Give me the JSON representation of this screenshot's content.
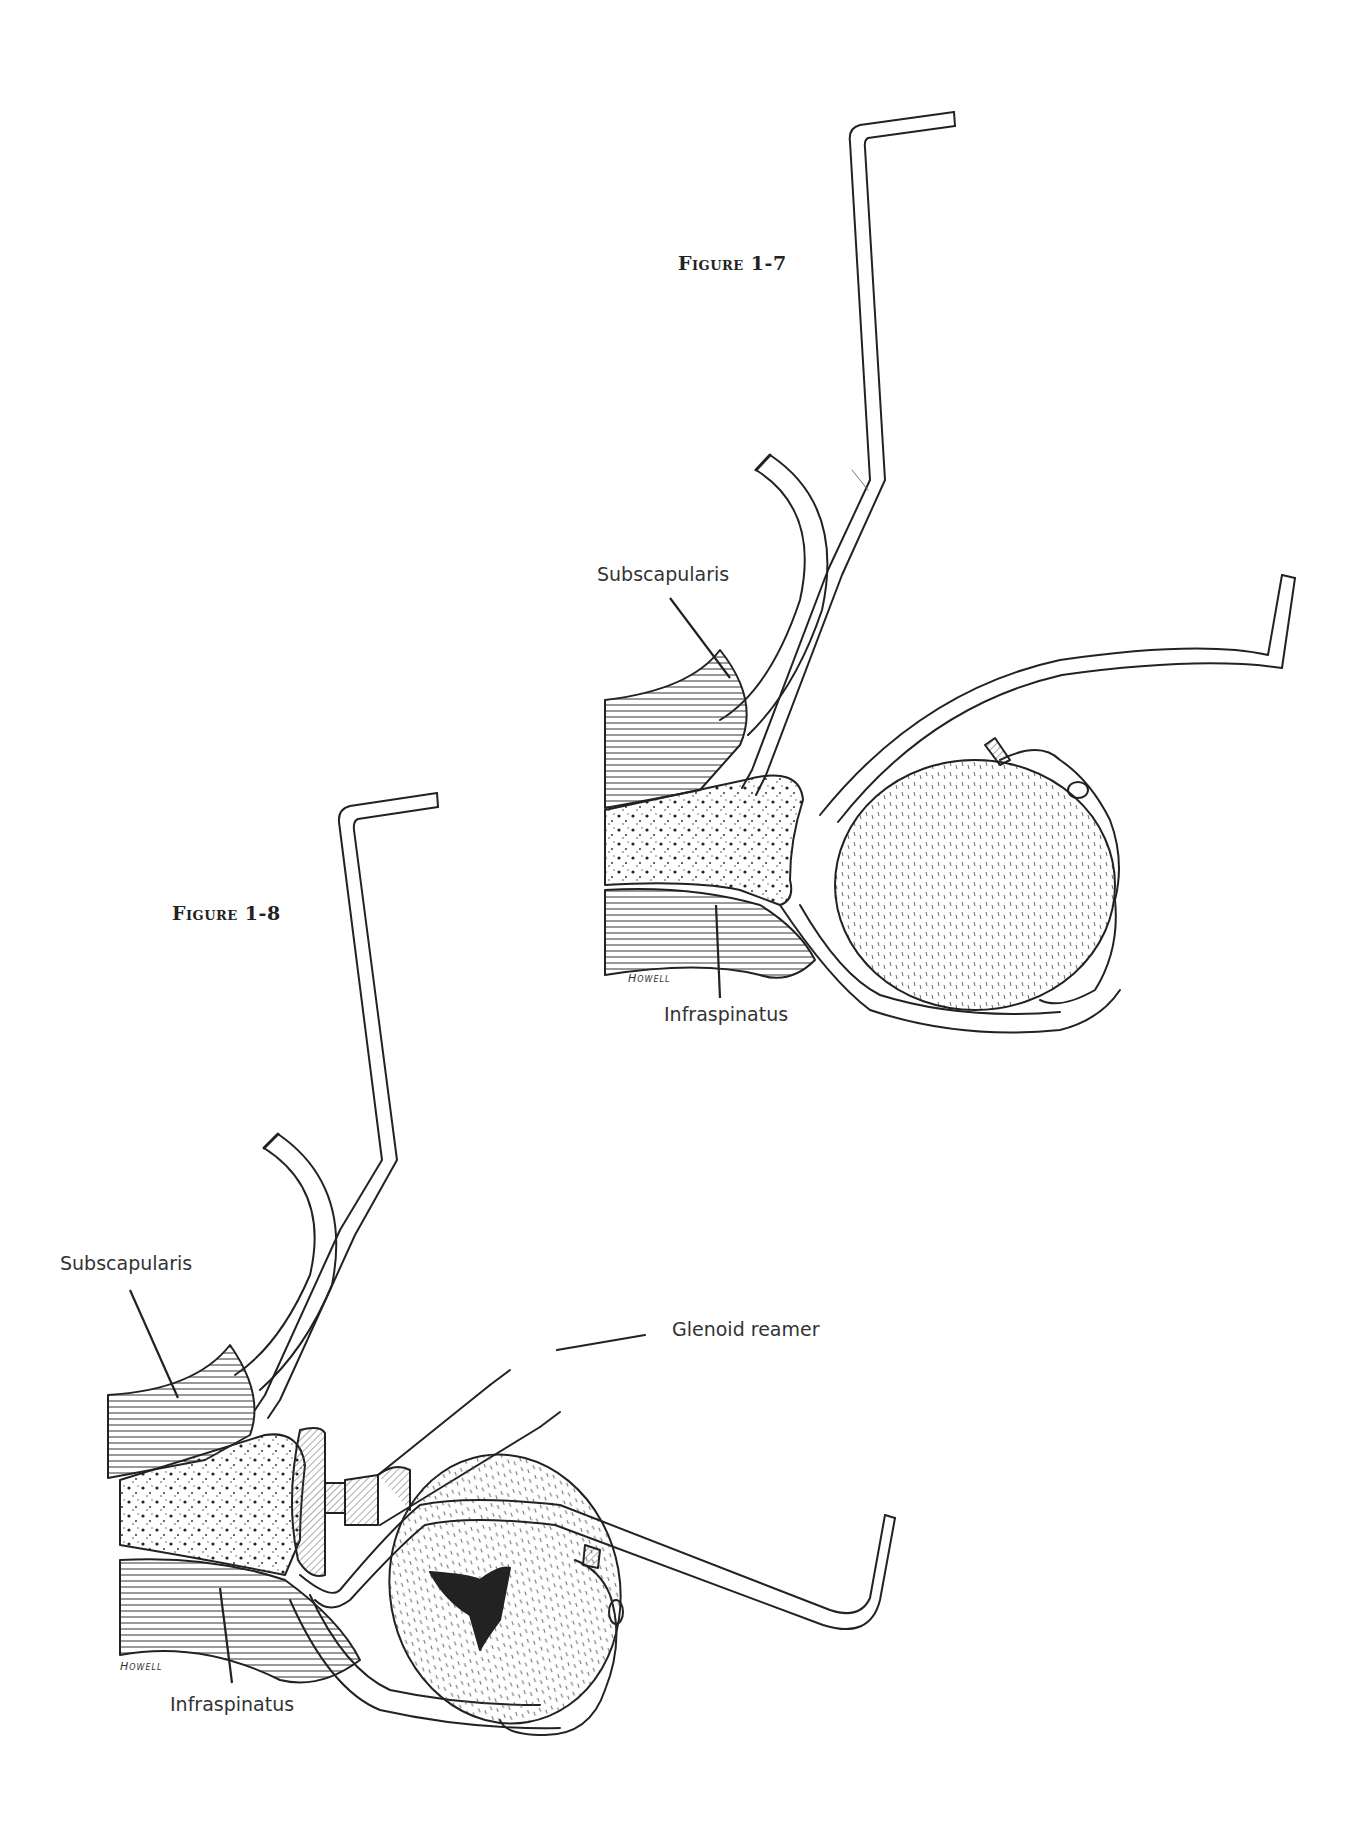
{
  "page": {
    "background": "#ffffff",
    "ink": "#222222"
  },
  "figures": [
    {
      "id": "figure-1-7",
      "title": "Figure 1-7",
      "signature": "Howell",
      "labels": {
        "subscapularis": "Subscapularis",
        "infraspinatus": "Infraspinatus"
      }
    },
    {
      "id": "figure-1-8",
      "title": "Figure 1-8",
      "signature": "Howell",
      "labels": {
        "subscapularis": "Subscapularis",
        "infraspinatus": "Infraspinatus",
        "glenoid_reamer": "Glenoid reamer"
      }
    }
  ]
}
